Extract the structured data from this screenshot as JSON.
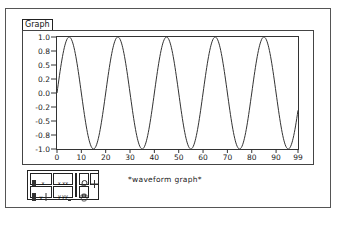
{
  "control": {
    "label": "Graph",
    "caption": "*waveform graph*"
  },
  "palette": {
    "buttons": [
      {
        "name": "x-scale-format-button",
        "glyph": "x"
      },
      {
        "name": "x-precision-button",
        "glyph": "x.xx"
      },
      {
        "name": "zoom-tool-button",
        "glyph": "zoom"
      },
      {
        "name": "cursor-tool-button",
        "glyph": "+"
      },
      {
        "name": "y-scale-format-button",
        "glyph": "y"
      },
      {
        "name": "y-precision-button",
        "glyph": "y.yy"
      },
      {
        "name": "pan-tool-button",
        "glyph": "hand"
      }
    ]
  },
  "chart_data": {
    "type": "line",
    "title": "Graph",
    "caption": "*waveform graph*",
    "xlabel": "",
    "ylabel": "",
    "xlim": [
      0,
      99
    ],
    "ylim": [
      -1.0,
      1.0
    ],
    "x_ticks": [
      "0",
      "10",
      "20",
      "30",
      "40",
      "50",
      "60",
      "70",
      "80",
      "90",
      "99"
    ],
    "y_ticks": [
      "1.0",
      "0.8",
      "0.5",
      "0.2",
      "0.0",
      "-0.2",
      "-0.5",
      "-0.8",
      "-1.0"
    ],
    "grid": false,
    "legend": null,
    "series": [
      {
        "name": "sine",
        "function": "sin(2*pi*x/20)",
        "period": 20,
        "amplitude": 1.0,
        "samples": 100,
        "peaks_at_x": [
          5,
          25,
          45,
          65,
          85
        ],
        "troughs_at_x": [
          15,
          35,
          55,
          75,
          95
        ]
      }
    ]
  }
}
